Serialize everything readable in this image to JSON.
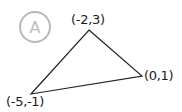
{
  "diagram": {
    "badge": {
      "label": "A",
      "color": "#b8b8b8"
    },
    "triangle": {
      "stroke": "#222222",
      "vertices": [
        {
          "name": "top",
          "label": "(-2,3)",
          "x": -2,
          "y": 3
        },
        {
          "name": "right",
          "label": "(0,1)",
          "x": 0,
          "y": 1
        },
        {
          "name": "bottom-left",
          "label": "(-5,-1)",
          "x": -5,
          "y": -1
        }
      ]
    }
  }
}
